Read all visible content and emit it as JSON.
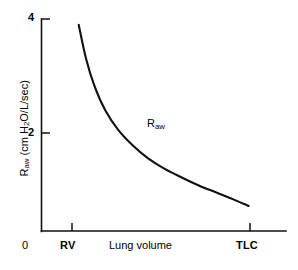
{
  "chart_data": {
    "type": "line",
    "title": "",
    "subtitle": "",
    "xlabel": "Lung volume",
    "ylabel": "Raw (cm H2O/L/sec)",
    "ylabel_main": "R",
    "ylabel_sub": "aw",
    "ylabel_rest_a": " (cm H",
    "ylabel_sub2": "2",
    "ylabel_rest_b": "O/L/sec)",
    "grid": false,
    "legend": "none",
    "xlim": [
      0,
      1
    ],
    "ylim": [
      0,
      4
    ],
    "yticks": [
      "2",
      "4"
    ],
    "ytick_values": [
      2,
      4
    ],
    "xticks": [
      "RV",
      "TLC"
    ],
    "xtick_positions": [
      0.175,
      0.975
    ],
    "origin_label": "0",
    "annotations": [
      {
        "text": "Raw",
        "main": "R",
        "sub": "aw",
        "x": 0.62,
        "y": 2.0
      }
    ],
    "series": [
      {
        "name": "Raw",
        "x": [
          0.175,
          0.21,
          0.25,
          0.3,
          0.36,
          0.43,
          0.5,
          0.58,
          0.66,
          0.74,
          0.82,
          0.9,
          0.975
        ],
        "y": [
          3.9,
          3.3,
          2.82,
          2.4,
          2.06,
          1.78,
          1.56,
          1.37,
          1.22,
          1.08,
          0.96,
          0.84,
          0.72
        ]
      }
    ]
  },
  "axes": {
    "y_tick_4": "4",
    "y_tick_2": "2",
    "x_origin": "0",
    "x_tick_rv": "RV",
    "x_tick_tlc": "TLC",
    "x_axis_title": "Lung volume"
  },
  "curve_label": {
    "main": "R",
    "sub": "aw"
  },
  "y_axis_label": {
    "part1": "R",
    "sub1": "aw",
    "part2": " (cm H",
    "sub2": "2",
    "part3": "O/L/sec)"
  },
  "colors": {
    "background": "#ffffff",
    "ink": "#000000",
    "curve": "#111111"
  }
}
